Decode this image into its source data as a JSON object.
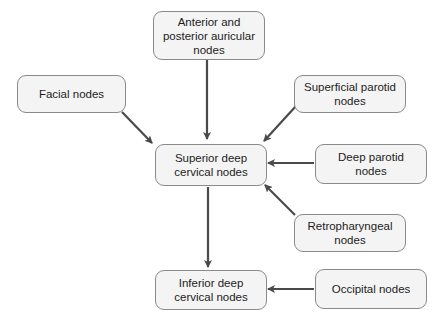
{
  "diagram": {
    "type": "flowchart",
    "nodes": {
      "auricular": {
        "label": "Anterior and posterior auricular nodes"
      },
      "facial": {
        "label": "Facial nodes"
      },
      "superficial_parotid": {
        "label": "Superficial parotid nodes"
      },
      "superior_deep": {
        "label": "Superior deep cervical nodes"
      },
      "deep_parotid": {
        "label": "Deep parotid nodes"
      },
      "retropharyngeal": {
        "label": "Retropharyngeal nodes"
      },
      "inferior_deep": {
        "label": "Inferior deep cervical nodes"
      },
      "occipital": {
        "label": "Occipital nodes"
      }
    },
    "edges": [
      {
        "from": "auricular",
        "to": "superior_deep"
      },
      {
        "from": "facial",
        "to": "superior_deep"
      },
      {
        "from": "superficial_parotid",
        "to": "superior_deep"
      },
      {
        "from": "deep_parotid",
        "to": "superior_deep"
      },
      {
        "from": "retropharyngeal",
        "to": "superior_deep"
      },
      {
        "from": "superior_deep",
        "to": "inferior_deep"
      },
      {
        "from": "occipital",
        "to": "inferior_deep"
      }
    ],
    "colors": {
      "node_fill": "#f4f4f4",
      "node_border": "#8a8a8a",
      "arrow": "#4a4a4a",
      "text": "#1c1c1c"
    }
  }
}
